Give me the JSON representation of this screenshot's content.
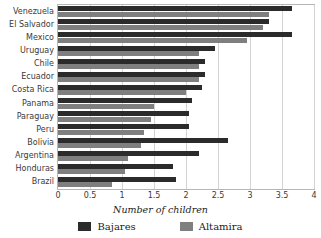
{
  "chart_data": {
    "type": "bar",
    "orientation": "horizontal",
    "title": "",
    "xlabel": "Number of children",
    "ylabel": "",
    "xlim": [
      0,
      4
    ],
    "xticks": [
      "0",
      "0.5",
      "1",
      "1.5",
      "2",
      "2.5",
      "3",
      "3.5",
      "4"
    ],
    "xtick_values": [
      0,
      0.5,
      1,
      1.5,
      2,
      2.5,
      3,
      3.5,
      4
    ],
    "grid": true,
    "legend_position": "bottom",
    "categories": [
      "Venezuela",
      "El Salvador",
      "Mexico",
      "Uruguay",
      "Chile",
      "Ecuador",
      "Costa Rica",
      "Panama",
      "Paraguay",
      "Peru",
      "Bolivia",
      "Argentina",
      "Honduras",
      "Brazil"
    ],
    "series": [
      {
        "name": "Bajares",
        "color": "#2b2b2b",
        "values": [
          3.65,
          3.3,
          3.65,
          2.45,
          2.3,
          2.3,
          2.25,
          2.1,
          2.05,
          2.05,
          2.65,
          2.2,
          1.8,
          1.85
        ]
      },
      {
        "name": "Altamira",
        "color": "#7f7f7f",
        "values": [
          3.3,
          3.2,
          2.95,
          2.2,
          2.2,
          2.2,
          2.0,
          1.5,
          1.45,
          1.35,
          1.3,
          1.1,
          1.05,
          0.85
        ]
      }
    ]
  },
  "legend": {
    "items": [
      {
        "label": "Bajares",
        "color": "#2b2b2b"
      },
      {
        "label": "Altamira",
        "color": "#7f7f7f"
      }
    ]
  },
  "axis": {
    "x_title": "Number of children"
  }
}
